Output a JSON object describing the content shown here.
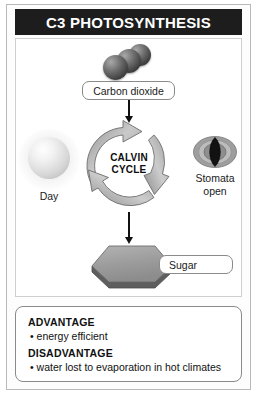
{
  "figure": {
    "title": "C3 PHOTOSYNTHESIS"
  },
  "diagram": {
    "co2": {
      "icon": "co2-molecule-icon",
      "label": "Carbon dioxide"
    },
    "cycle": {
      "icon": "circular-arrow-icon",
      "label_line1": "CALVIN",
      "label_line2": "CYCLE"
    },
    "day": {
      "icon": "sun-icon",
      "label": "Day"
    },
    "stomata": {
      "icon": "stomata-icon",
      "label_line1": "Stomata",
      "label_line2": "open"
    },
    "sugar": {
      "icon": "hexagon-icon",
      "label": "Sugar"
    },
    "arrows": {
      "co2_to_cycle": "arrow-down-icon",
      "cycle_to_sugar": "arrow-down-icon"
    }
  },
  "notes": {
    "advantage_heading": "ADVANTAGE",
    "advantage_item": "• energy efficient",
    "disadvantage_heading": "DISADVANTAGE",
    "disadvantage_item": "• water lost to evaporation in hot climates"
  },
  "colors": {
    "title_bar": "#1d1d1d",
    "title_text": "#ffffff",
    "frame_border": "#b9b9b9",
    "arrow": "#111111",
    "cycle_arrow_fill": "#b0b0b0",
    "hexagon_fill": "#9a9a9a",
    "molecule_fill": "#4a4a4a"
  }
}
